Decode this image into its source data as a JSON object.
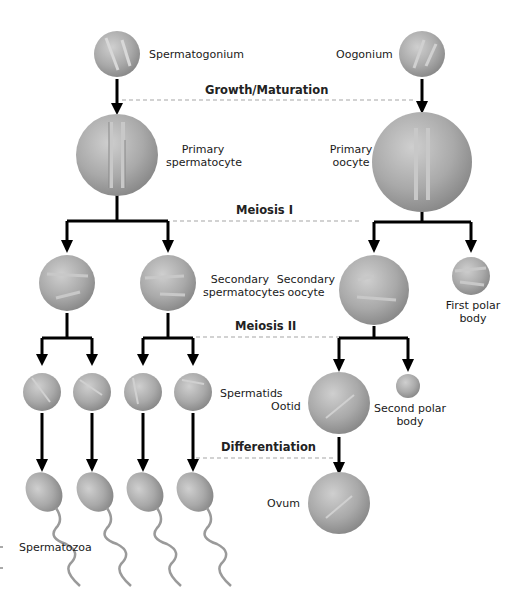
{
  "diagram": {
    "colors": {
      "cell_fill": "#a8a8a8",
      "cell_light": "#d6d6d6",
      "cell_dark": "#7d7d7d",
      "arrow": "#000000",
      "dashed": "#a0a0a0"
    },
    "stages": [
      {
        "id": "growth",
        "label": "Growth/Maturation"
      },
      {
        "id": "meiosis1",
        "label": "Meiosis I"
      },
      {
        "id": "meiosis2",
        "label": "Meiosis II"
      },
      {
        "id": "differentiation",
        "label": "Differentiation"
      }
    ],
    "male": {
      "spermatogonium": "Spermatogonium",
      "primary": "Primary\nspermatocyte",
      "primary_l1": "Primary",
      "primary_l2": "spermatocyte",
      "secondary_l1": "Secondary",
      "secondary_l2": "spermatocytes",
      "spermatids": "Spermatids",
      "spermatozoa": "Spermatozoa"
    },
    "female": {
      "oogonium": "Oogonium",
      "primary_l1": "Primary",
      "primary_l2": "oocyte",
      "secondary_l1": "Secondary",
      "secondary_l2": "oocyte",
      "first_polar_l1": "First polar",
      "first_polar_l2": "body",
      "ootid": "Ootid",
      "second_polar_l1": "Second polar",
      "second_polar_l2": "body",
      "ovum": "Ovum"
    }
  }
}
